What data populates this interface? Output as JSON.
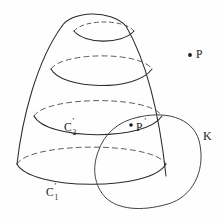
{
  "figure": {
    "kind": "hand-drawn-geometry-diagram",
    "background_color": "#fefefe",
    "ink_color": "#2b2b2b",
    "width": 222,
    "height": 222
  },
  "labels": {
    "point_p": {
      "text": "P",
      "x": 196,
      "y": 58
    },
    "point_p_prime": {
      "base": "P",
      "prime": "'",
      "x": 136,
      "y": 131
    },
    "curve_c1": {
      "base": "C",
      "prime": "'",
      "sub": "1",
      "x": 46,
      "y": 196
    },
    "curve_c2": {
      "base": "C",
      "prime": "'",
      "sub": "2",
      "x": 64,
      "y": 131
    },
    "curve_k": {
      "text": "K",
      "x": 203,
      "y": 140
    }
  },
  "points": {
    "p_dot": {
      "cx": 190,
      "cy": 55,
      "r": 1.9
    },
    "p_prime_dot": {
      "cx": 131,
      "cy": 125,
      "r": 1.8
    }
  },
  "paths": {
    "cone_left_edge": "M 17,164 C 22,120 36,62 62,26",
    "cone_right_edge": "M 166,176 C 160,120 148,64 126,26",
    "dome_top": "M 62,26 C 72,11 110,9 126,26",
    "ellipse_top_front": "M 74,31 C 84,44 122,45 134,31",
    "ellipse_top_back": "M 74,31 C 84,19 124,19 134,31",
    "ellipse_2_front": "M 51,69 C 62,90 136,92 152,69",
    "ellipse_2_back": "M 51,69 C 62,52 140,51 152,69",
    "ellipse_3_front": "M 34,116 C 46,140 145,142 162,116",
    "ellipse_3_back": "M 34,116 C 46,96 150,95 162,116",
    "ellipse_4_front": "M 17,164 C 30,190 150,192 166,164",
    "ellipse_4_back": "M 17,164 C 30,142 152,141 166,164",
    "knot_loop": "M 139,117 C 170,110 196,120 200,145 C 205,172 192,197 168,204 C 140,212 118,209 106,198 C 94,186 92,168 98,152 C 104,134 118,121 139,117",
    "knot_inner_crossing": "M 98,152 C 104,134 118,121 139,117"
  },
  "colors": {
    "ink": "#2b2b2b",
    "dashed_ink": "#4a4a4a",
    "background": "#fefefe"
  }
}
